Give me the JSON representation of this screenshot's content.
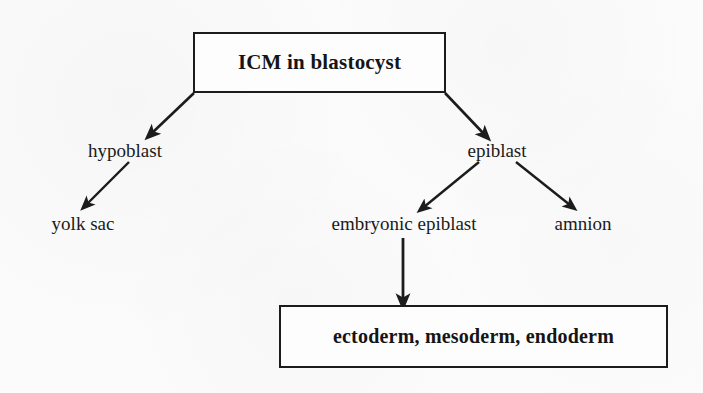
{
  "diagram": {
    "type": "flowchart",
    "title_node": "ICM in blastocyst",
    "background_color": "#fbfbfb",
    "stroke_color": "#1c1c1c",
    "nodes": [
      {
        "id": "icm",
        "label": "ICM in blastocyst",
        "style": "boxed-bold"
      },
      {
        "id": "hypoblast",
        "label": "hypoblast",
        "style": "plain"
      },
      {
        "id": "yolk_sac",
        "label": "yolk sac",
        "style": "plain"
      },
      {
        "id": "epiblast",
        "label": "epiblast",
        "style": "plain"
      },
      {
        "id": "embryonic_epiblast",
        "label": "embryonic epiblast",
        "style": "plain"
      },
      {
        "id": "amnion",
        "label": "amnion",
        "style": "plain"
      },
      {
        "id": "germ_layers",
        "label": "ectoderm, mesoderm, endoderm",
        "style": "boxed-bold"
      }
    ],
    "edges": [
      {
        "from": "icm",
        "to": "hypoblast",
        "kind": "arrow"
      },
      {
        "from": "icm",
        "to": "epiblast",
        "kind": "arrow"
      },
      {
        "from": "hypoblast",
        "to": "yolk_sac",
        "kind": "arrow"
      },
      {
        "from": "epiblast",
        "to": "embryonic_epiblast",
        "kind": "arrow"
      },
      {
        "from": "epiblast",
        "to": "amnion",
        "kind": "arrow"
      },
      {
        "from": "embryonic_epiblast",
        "to": "germ_layers",
        "kind": "arrow"
      }
    ]
  }
}
